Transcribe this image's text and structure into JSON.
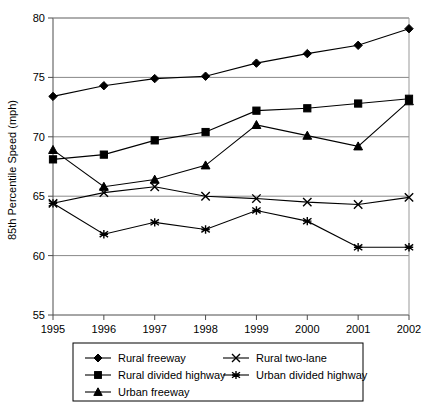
{
  "chart_data": {
    "type": "line",
    "title": "",
    "xlabel": "",
    "ylabel": "85th Percentile Speed (mph)",
    "x": [
      "1995",
      "1996",
      "1997",
      "1998",
      "1999",
      "2000",
      "2001",
      "2002"
    ],
    "xlim": [
      1995,
      2002
    ],
    "ylim": [
      55,
      80
    ],
    "yticks": [
      "55",
      "60",
      "65",
      "70",
      "75",
      "80"
    ],
    "grid": "horizontal",
    "legend_position": "bottom",
    "series": [
      {
        "name": "Rural freeway",
        "marker": "diamond",
        "values": [
          73.4,
          74.3,
          74.9,
          75.1,
          76.2,
          77.0,
          77.7,
          79.1
        ]
      },
      {
        "name": "Rural divided highway",
        "marker": "square",
        "values": [
          68.1,
          68.5,
          69.7,
          70.4,
          72.2,
          72.4,
          72.8,
          73.2
        ]
      },
      {
        "name": "Urban freeway",
        "marker": "triangle",
        "values": [
          68.9,
          65.8,
          66.4,
          67.6,
          71.0,
          70.1,
          69.2,
          73.0
        ]
      },
      {
        "name": "Rural two-lane",
        "marker": "x",
        "values": [
          64.4,
          65.3,
          65.8,
          65.0,
          64.8,
          64.5,
          64.3,
          64.9
        ]
      },
      {
        "name": "Urban divided highway",
        "marker": "asterisk",
        "values": [
          64.4,
          61.8,
          62.8,
          62.2,
          63.8,
          62.9,
          60.7,
          60.7
        ]
      }
    ]
  },
  "legend": {
    "items": [
      {
        "label": "Rural freeway",
        "marker": "diamond"
      },
      {
        "label": "Rural two-lane",
        "marker": "x"
      },
      {
        "label": "Rural divided highway",
        "marker": "square"
      },
      {
        "label": "Urban divided highway",
        "marker": "asterisk"
      },
      {
        "label": "Urban freeway",
        "marker": "triangle"
      }
    ]
  },
  "colors": {
    "ink": "#000000",
    "grid": "#888888",
    "axis": "#4d4d4d",
    "background": "#ffffff"
  }
}
